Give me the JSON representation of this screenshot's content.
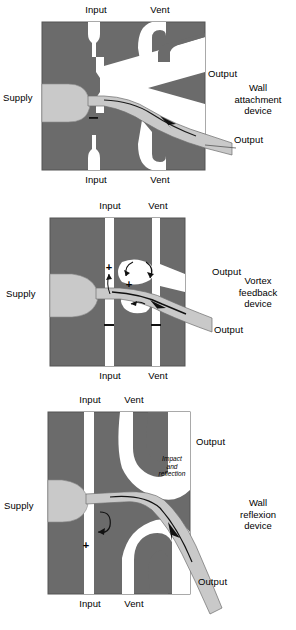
{
  "figure": {
    "colors": {
      "body_fill": "#6b6b6b",
      "channel_fill": "#ffffff",
      "jet_fill": "#c9c9c9",
      "jet_edge": "#4a4a4a",
      "outline": "#555555",
      "text": "#000000",
      "page_background": "#ffffff"
    }
  },
  "panels": [
    {
      "id": "wall-attachment",
      "device_name_lines": [
        "Wall",
        "attachment",
        "device"
      ],
      "labels": {
        "top_input": "Input",
        "top_vent": "Vent",
        "bottom_input": "Input",
        "bottom_vent": "Vent",
        "supply": "Supply",
        "output_upper": "Output",
        "output_lower": "Output"
      },
      "annotations": {
        "signs": [
          "−"
        ],
        "flow_arrow": true,
        "notes": []
      }
    },
    {
      "id": "vortex-feedback",
      "device_name_lines": [
        "Vortex",
        "feedback",
        "device"
      ],
      "labels": {
        "top_input": "Input",
        "top_vent": "Vent",
        "bottom_input": "Input",
        "bottom_vent": "Vent",
        "supply": "Supply",
        "output_upper": "Output",
        "output_lower": "Output"
      },
      "annotations": {
        "signs": [
          "+",
          "+",
          "−",
          "−"
        ],
        "flow_arrow": true,
        "notes": []
      }
    },
    {
      "id": "wall-reflexion",
      "device_name_lines": [
        "Wall",
        "reflexion",
        "device"
      ],
      "labels": {
        "top_input": "Input",
        "top_vent": "Vent",
        "bottom_input": "Input",
        "bottom_vent": "Vent",
        "supply": "Supply",
        "output_upper": "Output",
        "output_lower": "Output"
      },
      "annotations": {
        "signs": [
          "+"
        ],
        "flow_arrow": true,
        "notes": [
          "Impact",
          "and",
          "reflexion_note_text"
        ],
        "impact_lines": [
          "Impact",
          "and",
          "reflection"
        ]
      }
    }
  ]
}
